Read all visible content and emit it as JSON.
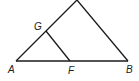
{
  "diagram": {
    "type": "geometry-triangle",
    "stroke_color": "#1a1a1a",
    "points": {
      "apex": {
        "x": 77,
        "y": 0
      },
      "A": {
        "x": 16,
        "y": 61,
        "label": "A"
      },
      "B": {
        "x": 128,
        "y": 61,
        "label": "B"
      },
      "G": {
        "x": 46,
        "y": 31,
        "label": "G"
      },
      "F": {
        "x": 70,
        "y": 61,
        "label": "F"
      }
    },
    "labels": {
      "A": "A",
      "B": "B",
      "G": "G",
      "F": "F"
    },
    "segments": [
      [
        "A",
        "apex"
      ],
      [
        "apex",
        "B"
      ],
      [
        "A",
        "B"
      ],
      [
        "G",
        "F"
      ]
    ]
  }
}
